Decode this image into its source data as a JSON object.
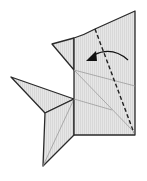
{
  "diagram": {
    "colors": {
      "paper_fill": "#e4e4e4",
      "outline": "#2a2a2a",
      "crease": "#9a9a9a",
      "fold_line": "#222222",
      "arrow": "#111111",
      "background": "#ffffff"
    },
    "elements": [
      {
        "id": "main-body",
        "type": "polygon",
        "desc": "Main rectangular body with slanted top edge"
      },
      {
        "id": "top-flap",
        "type": "polygon",
        "desc": "Small triangular flap at upper left"
      },
      {
        "id": "left-fin",
        "type": "polygon",
        "desc": "Long pointed fin to the left"
      },
      {
        "id": "lower-fin",
        "type": "polygon",
        "desc": "Lower fin pointing downward"
      },
      {
        "id": "valley-fold-line",
        "type": "dashed-line",
        "desc": "Valley fold line, diagonal"
      },
      {
        "id": "fold-arrow",
        "type": "curved-arrow",
        "desc": "Arrow indicating fold direction to the left"
      }
    ]
  }
}
